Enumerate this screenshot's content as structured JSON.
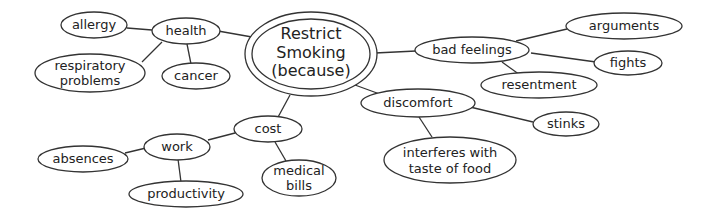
{
  "diagram": {
    "type": "concept web",
    "center": {
      "id": "center",
      "lines": [
        "Restrict",
        "Smoking",
        "(because)"
      ]
    },
    "nodes": [
      {
        "id": "health",
        "label": "health"
      },
      {
        "id": "allergy",
        "label": "allergy"
      },
      {
        "id": "respiratory",
        "lines": [
          "respiratory",
          "problems"
        ]
      },
      {
        "id": "cancer",
        "label": "cancer"
      },
      {
        "id": "bad_feelings",
        "label": "bad feelings"
      },
      {
        "id": "arguments",
        "label": "arguments"
      },
      {
        "id": "fights",
        "label": "fights"
      },
      {
        "id": "resentment",
        "label": "resentment"
      },
      {
        "id": "discomfort",
        "label": "discomfort"
      },
      {
        "id": "stinks",
        "label": "stinks"
      },
      {
        "id": "taste",
        "lines": [
          "interferes with",
          "taste of food"
        ]
      },
      {
        "id": "cost",
        "label": "cost"
      },
      {
        "id": "work",
        "label": "work"
      },
      {
        "id": "absences",
        "label": "absences"
      },
      {
        "id": "productivity",
        "label": "productivity"
      },
      {
        "id": "medical",
        "lines": [
          "medical",
          "bills"
        ]
      }
    ],
    "edges": [
      [
        "center",
        "health"
      ],
      [
        "health",
        "allergy"
      ],
      [
        "health",
        "respiratory"
      ],
      [
        "health",
        "cancer"
      ],
      [
        "center",
        "bad_feelings"
      ],
      [
        "bad_feelings",
        "arguments"
      ],
      [
        "bad_feelings",
        "fights"
      ],
      [
        "bad_feelings",
        "resentment"
      ],
      [
        "center",
        "discomfort"
      ],
      [
        "discomfort",
        "stinks"
      ],
      [
        "discomfort",
        "taste"
      ],
      [
        "center",
        "cost"
      ],
      [
        "cost",
        "work"
      ],
      [
        "cost",
        "medical"
      ],
      [
        "work",
        "absences"
      ],
      [
        "work",
        "productivity"
      ]
    ]
  }
}
